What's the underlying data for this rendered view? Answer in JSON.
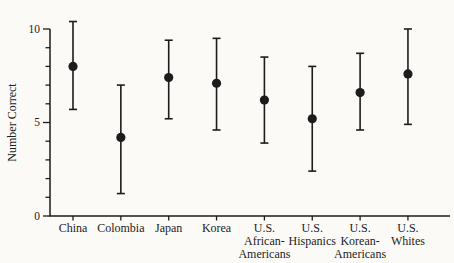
{
  "figure": {
    "background": "#fbfaf7",
    "ink": "#1c1c1c"
  },
  "chart_data": {
    "type": "scatter",
    "variant": "mean-dots-with-error-bars",
    "title": "",
    "xlabel": "",
    "ylabel": "Number Correct",
    "ylim": [
      0,
      10
    ],
    "yticks_labeled": [
      0,
      5,
      10
    ],
    "yticks_minor_every": 1,
    "grid": false,
    "legend": "none",
    "categories": [
      "China",
      "Colombia",
      "Japan",
      "Korea",
      "U.S. African-Americans",
      "U.S. Hispanics",
      "U.S. Korean-Americans",
      "U.S. Whites"
    ],
    "category_label_lines": [
      [
        "China"
      ],
      [
        "Colombia"
      ],
      [
        "Japan"
      ],
      [
        "Korea"
      ],
      [
        "U.S.",
        "African-",
        "Americans"
      ],
      [
        "U.S.",
        "Hispanics"
      ],
      [
        "U.S.",
        "Korean-",
        "Americans"
      ],
      [
        "U.S.",
        "Whites"
      ]
    ],
    "series": [
      {
        "name": "Number Correct (mean, error bars)",
        "points": [
          {
            "category": "China",
            "mean": 8.0,
            "low": 5.7,
            "high": 10.4
          },
          {
            "category": "Colombia",
            "mean": 4.2,
            "low": 1.2,
            "high": 7.0
          },
          {
            "category": "Japan",
            "mean": 7.4,
            "low": 5.2,
            "high": 9.4
          },
          {
            "category": "Korea",
            "mean": 7.1,
            "low": 4.6,
            "high": 9.5
          },
          {
            "category": "U.S. African-Americans",
            "mean": 6.2,
            "low": 3.9,
            "high": 8.5
          },
          {
            "category": "U.S. Hispanics",
            "mean": 5.2,
            "low": 2.4,
            "high": 8.0
          },
          {
            "category": "U.S. Korean-Americans",
            "mean": 6.6,
            "low": 4.6,
            "high": 8.7
          },
          {
            "category": "U.S. Whites",
            "mean": 7.6,
            "low": 4.9,
            "high": 10.0
          }
        ]
      }
    ],
    "marker": {
      "shape": "filled-circle",
      "color": "#1c1c1c"
    }
  }
}
